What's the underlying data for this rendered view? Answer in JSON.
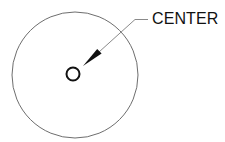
{
  "diagram": {
    "label": "CENTER",
    "colors": {
      "background": "#ffffff",
      "outer_circle": "#6e6e6e",
      "inner_circle": "#111111",
      "leader": "#8a8a8a",
      "arrowhead": "#111111",
      "text": "#111111"
    },
    "outer_circle": {
      "cx": 75,
      "cy": 75,
      "r": 63
    },
    "inner_circle": {
      "cx": 73,
      "cy": 74,
      "r": 6.5
    },
    "leader": {
      "points": [
        [
          148,
          19.5
        ],
        [
          135,
          19.5
        ],
        [
          83,
          66
        ]
      ],
      "arrow_tip": [
        83,
        66
      ]
    }
  }
}
